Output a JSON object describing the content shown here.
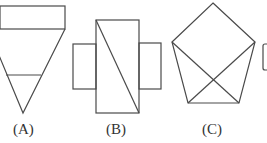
{
  "diagram": {
    "stroke_color": "#4a4a4a",
    "figures": [
      {
        "id": "A",
        "label": "(A)",
        "description": "rectangle on top of inverted triangle with horizontal line"
      },
      {
        "id": "B",
        "label": "(B)",
        "description": "cross shape with diagonal line"
      },
      {
        "id": "C",
        "label": "(C)",
        "description": "pentagon with two crossing diagonals"
      },
      {
        "id": "D",
        "label": "",
        "description": "partially visible figure cut off at right edge"
      }
    ]
  }
}
